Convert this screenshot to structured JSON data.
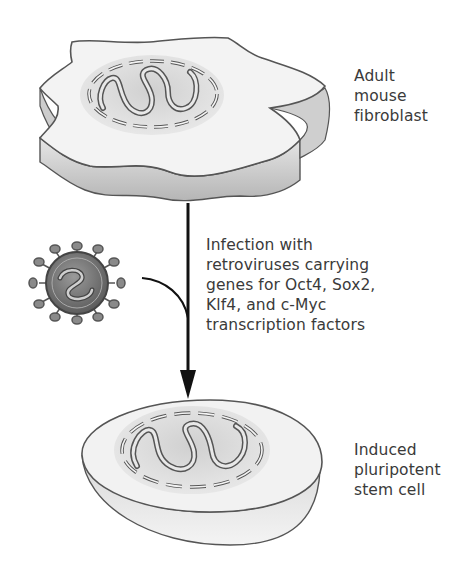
{
  "figure": {
    "labels": {
      "fibroblast": "Adult\nmouse\nfibroblast",
      "infection": "Infection with\nretroviruses carrying\ngenes for Oct4, Sox2,\nKlf4, and c-Myc\ntranscription factors",
      "ips_cell": "Induced\npluripotent\nstem cell"
    },
    "elements": {
      "top_cell": "adult-mouse-fibroblast",
      "virus": "retrovirus",
      "bottom_cell": "induced-pluripotent-stem-cell",
      "arrow": "down-arrow"
    },
    "colors": {
      "cell_top": "#f2f2f2",
      "cell_side": "#c8c8c8",
      "nucleus": "#d9d9d9",
      "outline": "#555555",
      "arrow": "#111111",
      "virus_body": "#7a7a7a"
    }
  }
}
